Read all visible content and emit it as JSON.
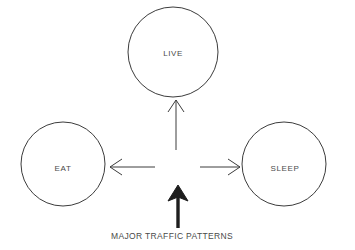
{
  "diagram": {
    "title": "Major Traffic Patterns",
    "background_color": "#ffffff",
    "stroke_color": "#3c3c3c",
    "bold_stroke_color": "#1e1e1e",
    "text_color": "#4a4a4a",
    "nodes": [
      {
        "id": "live",
        "label": "LIVE",
        "shape": "circle",
        "cx": 173,
        "cy": 52,
        "r": 45
      },
      {
        "id": "eat",
        "label": "EAT",
        "shape": "circle",
        "cx": 63,
        "cy": 164,
        "r": 42
      },
      {
        "id": "sleep",
        "label": "SLEEP",
        "shape": "circle",
        "cx": 284,
        "cy": 164,
        "r": 42
      }
    ],
    "arrows": [
      {
        "id": "arrow-to-live",
        "direction": "up",
        "style": "thin",
        "target": "live"
      },
      {
        "id": "arrow-to-eat",
        "direction": "left",
        "style": "thin",
        "target": "eat"
      },
      {
        "id": "arrow-to-sleep",
        "direction": "right",
        "style": "thin",
        "target": "sleep"
      },
      {
        "id": "arrow-inbound-traffic",
        "direction": "up",
        "style": "bold",
        "target": "hub"
      }
    ],
    "caption": {
      "text": "MAJOR TRAFFIC PATTERNS",
      "x": 172,
      "y": 236
    }
  }
}
